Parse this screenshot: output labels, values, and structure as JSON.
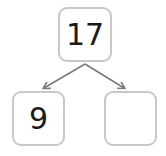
{
  "number_bond": {
    "whole": "17",
    "part_left": "9",
    "part_right": ""
  },
  "colors": {
    "box_border": "#c8c8c8",
    "arrow": "#7a7a7a",
    "text": "#1a1a1a"
  }
}
